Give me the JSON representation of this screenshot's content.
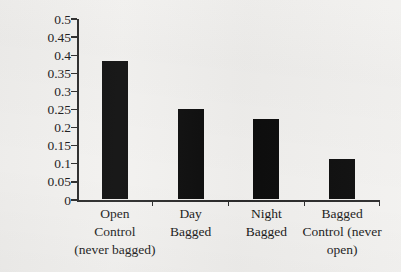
{
  "chart_data": {
    "type": "bar",
    "title": "",
    "subtitle": "",
    "xlabel": "",
    "ylabel": "Proportion Flowers Fertilized",
    "categories": [
      "Open Control (never bagged)",
      "Day Bagged",
      "Night Bagged",
      "Bagged Control (never open)"
    ],
    "category_lines": [
      [
        "Open",
        "Control",
        "(never bagged)"
      ],
      [
        "Day",
        "Bagged"
      ],
      [
        "Night",
        "Bagged"
      ],
      [
        "Bagged",
        "Control (never",
        "open)"
      ]
    ],
    "values": [
      0.38,
      0.25,
      0.22,
      0.11
    ],
    "ylim": [
      0,
      0.5
    ],
    "ytick_labels": [
      "0",
      "0.05",
      "0.1",
      "0.15",
      "0.2",
      "0.25",
      "0.3",
      "0.35",
      "0.4",
      "0.45",
      "0.5"
    ],
    "ytick_values": [
      0,
      0.05,
      0.1,
      0.15,
      0.2,
      0.25,
      0.3,
      0.35,
      0.4,
      0.45,
      0.5
    ],
    "grid": false,
    "legend": false,
    "legend_position": "none",
    "bar_color": "#0d0d0d",
    "axis_color": "#2b2b2b",
    "background_color": "#f2f1ef"
  }
}
